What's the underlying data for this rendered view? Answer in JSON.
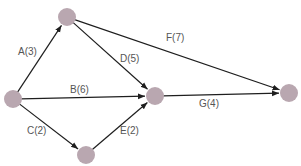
{
  "diagram": {
    "type": "activity-on-arrow network",
    "colors": {
      "node_fill": "#b9a7b0",
      "edge": "#1e1e1e",
      "label": "#555555",
      "background": "#ffffff"
    },
    "nodes": [
      {
        "id": "n0",
        "x": 13,
        "y": 99,
        "r": 9
      },
      {
        "id": "n1",
        "x": 67,
        "y": 17,
        "r": 9
      },
      {
        "id": "n2",
        "x": 86,
        "y": 155,
        "r": 9
      },
      {
        "id": "n3",
        "x": 155,
        "y": 96,
        "r": 9
      },
      {
        "id": "n4",
        "x": 289,
        "y": 93,
        "r": 9
      }
    ],
    "edges": [
      {
        "id": "A",
        "from": "n0",
        "to": "n1",
        "label": "A(3)",
        "duration": 3,
        "label_x": 18,
        "label_y": 47
      },
      {
        "id": "B",
        "from": "n0",
        "to": "n3",
        "label": "B(6)",
        "duration": 6,
        "label_x": 70,
        "label_y": 85
      },
      {
        "id": "C",
        "from": "n0",
        "to": "n2",
        "label": "C(2)",
        "duration": 2,
        "label_x": 27,
        "label_y": 126
      },
      {
        "id": "D",
        "from": "n1",
        "to": "n3",
        "label": "D(5)",
        "duration": 5,
        "label_x": 120,
        "label_y": 54
      },
      {
        "id": "E",
        "from": "n2",
        "to": "n3",
        "label": "E(2)",
        "duration": 2,
        "label_x": 120,
        "label_y": 126
      },
      {
        "id": "F",
        "from": "n1",
        "to": "n4",
        "label": "F(7)",
        "duration": 7,
        "label_x": 166,
        "label_y": 33
      },
      {
        "id": "G",
        "from": "n3",
        "to": "n4",
        "label": "G(4)",
        "duration": 4,
        "label_x": 199,
        "label_y": 99
      }
    ]
  }
}
